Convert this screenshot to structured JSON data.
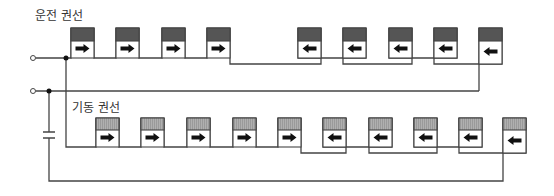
{
  "diagram": {
    "title_run_winding": "운전 권선",
    "title_start_winding": "기동 권선",
    "colors": {
      "wire": "#444444",
      "run_coil_fill": "#555555",
      "start_coil_fill": "#aaaaaa",
      "arrow": "#111111"
    },
    "run_winding": {
      "coil_count": 9,
      "directions": [
        "right",
        "right",
        "right",
        "right",
        "left",
        "left",
        "left",
        "left",
        "left"
      ],
      "x_positions": [
        71,
        116,
        162,
        207,
        298,
        343,
        389,
        434,
        479
      ]
    },
    "start_winding": {
      "coil_count": 10,
      "directions": [
        "right",
        "right",
        "right",
        "right",
        "right",
        "left",
        "left",
        "left",
        "left",
        "left"
      ],
      "x_positions": [
        96,
        141,
        187,
        233,
        278,
        323,
        369,
        414,
        459,
        503
      ]
    },
    "terminals": [
      {
        "name": "terminal-1",
        "x": 33,
        "y": 58
      },
      {
        "name": "terminal-2",
        "x": 33,
        "y": 91
      }
    ],
    "components": [
      "capacitor"
    ]
  }
}
